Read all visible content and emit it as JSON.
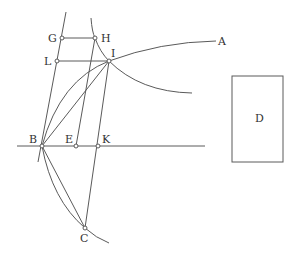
{
  "diagram": {
    "type": "geometric-construction",
    "stroke_color": "#5a5a5a",
    "label_color": "#333333",
    "points": [
      {
        "id": "G",
        "label": "G",
        "x": 62,
        "y": 38,
        "lx": 48,
        "ly": 42
      },
      {
        "id": "H",
        "label": "H",
        "x": 95,
        "y": 38,
        "lx": 101,
        "ly": 42
      },
      {
        "id": "L",
        "label": "L",
        "x": 57,
        "y": 61,
        "lx": 44,
        "ly": 65
      },
      {
        "id": "I",
        "label": "I",
        "x": 109,
        "y": 61,
        "lx": 111,
        "ly": 57
      },
      {
        "id": "B",
        "label": "B",
        "x": 42,
        "y": 146,
        "lx": 29,
        "ly": 143
      },
      {
        "id": "E",
        "label": "E",
        "x": 76,
        "y": 146,
        "lx": 65,
        "ly": 143
      },
      {
        "id": "K",
        "label": "K",
        "x": 98,
        "y": 146,
        "lx": 102,
        "ly": 143
      },
      {
        "id": "C",
        "label": "C",
        "x": 85,
        "y": 228,
        "lx": 80,
        "ly": 242
      }
    ],
    "labels_only": [
      {
        "id": "A",
        "label": "A",
        "x": 218,
        "y": 45
      },
      {
        "id": "D",
        "label": "D",
        "x": 255,
        "y": 122
      }
    ],
    "rectangle_D": {
      "x": 232,
      "y": 76,
      "width": 51,
      "height": 86
    }
  }
}
